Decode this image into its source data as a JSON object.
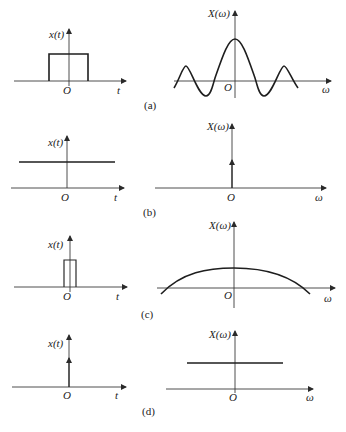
{
  "figure": {
    "panels": [
      {
        "caption": "(a)",
        "time": {
          "ylabel": "x(t)",
          "xlabel": "t",
          "origin": "O",
          "signal": "rectangular pulse"
        },
        "freq": {
          "ylabel": "X(ω)",
          "xlabel": "ω",
          "origin": "O",
          "signal": "sinc"
        }
      },
      {
        "caption": "(b)",
        "time": {
          "ylabel": "x(t)",
          "xlabel": "t",
          "origin": "O",
          "signal": "constant"
        },
        "freq": {
          "ylabel": "X(ω)",
          "xlabel": "ω",
          "origin": "O",
          "signal": "impulse at origin"
        }
      },
      {
        "caption": "(c)",
        "time": {
          "ylabel": "x(t)",
          "xlabel": "t",
          "origin": "O",
          "signal": "narrow rectangular pulse"
        },
        "freq": {
          "ylabel": "X(ω)",
          "xlabel": "ω",
          "origin": "O",
          "signal": "wide sinc main lobe"
        }
      },
      {
        "caption": "(d)",
        "time": {
          "ylabel": "x(t)",
          "xlabel": "t",
          "origin": "O",
          "signal": "impulse at origin"
        },
        "freq": {
          "ylabel": "X(ω)",
          "xlabel": "ω",
          "origin": "O",
          "signal": "constant"
        }
      }
    ]
  }
}
